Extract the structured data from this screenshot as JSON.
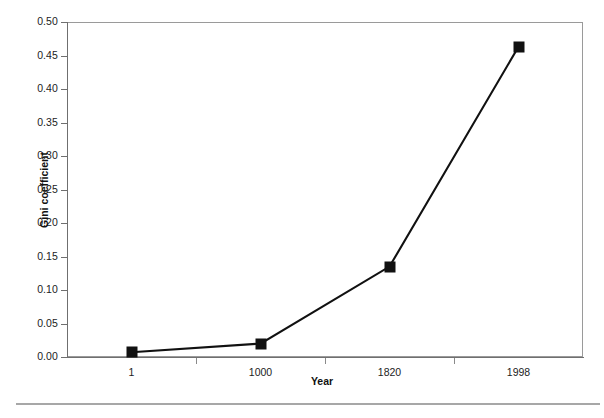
{
  "chart_data": {
    "type": "line",
    "title": "",
    "subtitle": "",
    "xlabel": "Year",
    "ylabel": "Gini coefficient",
    "categories": [
      "1",
      "1000",
      "1820",
      "1998"
    ],
    "values": [
      0.007,
      0.02,
      0.135,
      0.463
    ],
    "series": [
      {
        "name": "Gini coefficient",
        "values": [
          0.007,
          0.02,
          0.135,
          0.463
        ],
        "color": "#111111",
        "marker": "square",
        "marker_color": "#111111"
      }
    ],
    "ylim": [
      0.0,
      0.5
    ],
    "ytick_labels": [
      "0.50",
      "0.45",
      "0.40",
      "0.35",
      "0.30",
      "0.25",
      "0.20",
      "0.15",
      "0.10",
      "0.05",
      "0.00"
    ],
    "ytick_values": [
      0.5,
      0.45,
      0.4,
      0.35,
      0.3,
      0.25,
      0.2,
      0.15,
      0.1,
      0.05,
      0.0
    ],
    "xtick_labels": [
      "1",
      "1000",
      "1820",
      "1998"
    ],
    "grid": false,
    "legend": false,
    "legend_position": "none",
    "plot_border_color": "#9a9a9a",
    "axis_color": "#6f6f6f",
    "background_color": "#ffffff"
  },
  "figure": {
    "footer_rule_color": "#a7a7a7"
  }
}
